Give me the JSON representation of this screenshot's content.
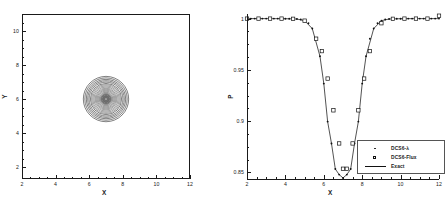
{
  "figure": {
    "background": "#ffffff",
    "line_color": "#1a1a1a"
  },
  "panels": {
    "left": {
      "name": "contour-panel",
      "xlabel": "X",
      "ylabel": "Y",
      "xticks": [
        "2",
        "4",
        "6",
        "8",
        "10",
        "12"
      ],
      "yticks": [
        "2",
        "4",
        "6",
        "8",
        "10"
      ]
    },
    "right": {
      "name": "profile-panel",
      "xlabel": "X",
      "ylabel": "P",
      "xticks": [
        "2",
        "4",
        "6",
        "8",
        "10",
        "12"
      ],
      "yticks": [
        "0.85",
        "0.9",
        "0.95",
        "1"
      ]
    }
  },
  "legend": {
    "items": [
      {
        "label": "DCS6-λ",
        "symbol": "dot-marker"
      },
      {
        "label": "DCS6-Flux",
        "symbol": "open-square-marker"
      },
      {
        "label": "Exact",
        "symbol": "solid-line"
      }
    ]
  },
  "chart_data": [
    {
      "type": "contour",
      "name": "isentropic-vortex-density-contours",
      "title": "",
      "xlabel": "X",
      "ylabel": "Y",
      "xlim": [
        2,
        12
      ],
      "ylim": [
        1.3,
        11.0
      ],
      "xticks": [
        2,
        4,
        6,
        8,
        10,
        12
      ],
      "yticks": [
        2,
        4,
        6,
        8,
        10
      ],
      "grid": false,
      "frame": "full-box",
      "legend_position": "none",
      "annotation": "Concentric circular contour rings of a vortex centred at (7, 6); outermost ring radius ~1.35, rings crowd toward the centre leaving a small white core.",
      "center": [
        7.0,
        6.0
      ],
      "contour_radii": [
        1.35,
        1.26,
        1.17,
        1.09,
        1.01,
        0.93,
        0.86,
        0.79,
        0.72,
        0.65,
        0.59,
        0.53,
        0.47,
        0.41,
        0.36,
        0.31,
        0.26,
        0.21,
        0.17,
        0.13,
        0.09
      ]
    },
    {
      "type": "line",
      "name": "pressure-profile-along-centreline",
      "title": "",
      "xlabel": "X",
      "ylabel": "P",
      "xlim": [
        2,
        12
      ],
      "ylim": [
        0.8435,
        1.0045
      ],
      "xticks": [
        2,
        4,
        6,
        8,
        10,
        12
      ],
      "yticks": [
        0.85,
        0.9,
        0.95,
        1
      ],
      "grid": false,
      "frame": "left-bottom-only",
      "legend_position": "lower-right",
      "series": [
        {
          "name": "DCS6-λ",
          "style": "dot-marker",
          "x": [
            2.0,
            2.2,
            2.4,
            2.6,
            2.8,
            3.0,
            3.2,
            3.4,
            3.6,
            3.8,
            4.0,
            4.2,
            4.4,
            4.6,
            4.8,
            5.0,
            5.2,
            5.4,
            5.6,
            5.8,
            6.0,
            6.2,
            6.4,
            6.6,
            6.8,
            7.0,
            7.2,
            7.4,
            7.6,
            7.8,
            8.0,
            8.2,
            8.4,
            8.6,
            8.8,
            9.0,
            9.2,
            9.4,
            9.6,
            9.8,
            10.0,
            10.2,
            10.4,
            10.6,
            10.8,
            11.0,
            11.2,
            11.4,
            11.6,
            11.8,
            12.0
          ],
          "y": [
            1.0,
            1.0,
            1.0,
            1.0,
            1.0,
            1.0,
            1.0,
            1.0,
            1.0,
            1.0,
            0.9999,
            0.9999,
            0.9998,
            0.9996,
            0.9991,
            0.998,
            0.9955,
            0.9903,
            0.9804,
            0.9633,
            0.9366,
            0.8995,
            0.8782,
            0.8532,
            0.8478,
            0.8445,
            0.8478,
            0.8532,
            0.8782,
            0.8995,
            0.9366,
            0.9633,
            0.9804,
            0.9903,
            0.9955,
            0.998,
            0.9991,
            0.9996,
            0.9998,
            0.9999,
            0.9999,
            1.0,
            1.0,
            1.0,
            1.0,
            1.0,
            1.0,
            1.0,
            1.0,
            1.0,
            1.0
          ]
        },
        {
          "name": "DCS6-Flux",
          "style": "open-square-marker",
          "x": [
            2.0,
            2.6,
            3.2,
            3.8,
            4.4,
            5.0,
            5.6,
            5.9,
            6.2,
            6.5,
            6.8,
            7.0,
            7.2,
            7.5,
            7.8,
            8.1,
            8.4,
            9.0,
            9.6,
            10.2,
            10.8,
            11.4,
            12.0
          ],
          "y": [
            1.0,
            1.0,
            1.0,
            1.0,
            0.9998,
            0.998,
            0.9804,
            0.9683,
            0.9415,
            0.9105,
            0.8782,
            0.8535,
            0.8535,
            0.8782,
            0.9105,
            0.9415,
            0.9683,
            0.9955,
            0.9998,
            1.0,
            1.0,
            1.0
          ]
        },
        {
          "name": "Exact",
          "style": "solid-line",
          "x": [
            2.0,
            3.0,
            4.0,
            4.6,
            5.0,
            5.4,
            5.8,
            6.0,
            6.2,
            6.4,
            6.6,
            6.8,
            7.0,
            7.2,
            7.4,
            7.6,
            7.8,
            8.0,
            8.2,
            8.6,
            9.0,
            9.4,
            10.0,
            11.0,
            12.0
          ],
          "y": [
            1.0,
            1.0,
            0.9999,
            0.9996,
            0.998,
            0.9903,
            0.9633,
            0.9366,
            0.8995,
            0.8782,
            0.8532,
            0.8478,
            0.8445,
            0.8478,
            0.8532,
            0.8782,
            0.8995,
            0.9366,
            0.9633,
            0.9903,
            0.998,
            0.9996,
            0.9999,
            1.0,
            1.0
          ]
        }
      ]
    }
  ]
}
